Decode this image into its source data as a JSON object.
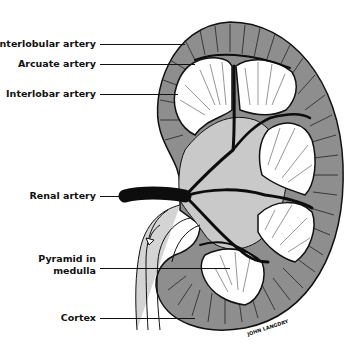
{
  "figure": {
    "colors": {
      "cortex": "#8e8e8e",
      "sinus": "#c9c9c9",
      "pyramid": "#ffffff",
      "artery": "#0d0d0d",
      "background": "#ffffff"
    }
  },
  "labels": [
    {
      "id": "interlobular",
      "text": "Interlobular artery"
    },
    {
      "id": "arcuate",
      "text": "Arcuate artery"
    },
    {
      "id": "interlobar",
      "text": "Interlobar artery"
    },
    {
      "id": "renal",
      "text": "Renal artery"
    },
    {
      "id": "pyramid_line1",
      "text": "Pyramid in"
    },
    {
      "id": "pyramid_line2",
      "text": "medulla"
    },
    {
      "id": "cortex",
      "text": "Cortex"
    }
  ],
  "signature": "JOHN LANGDRY"
}
